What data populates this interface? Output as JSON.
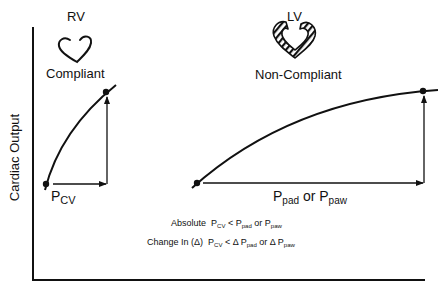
{
  "diagram": {
    "y_axis_label": "Cardiac Output",
    "rv": {
      "title": "RV",
      "heart_icon": "outline-heart-icon",
      "status": "Compliant",
      "pressure_label": {
        "base": "P",
        "subscript": "CV"
      }
    },
    "lv": {
      "title": "LV",
      "heart_icon": "hatched-thick-heart-icon",
      "status": "Non-Compliant",
      "pressure_label": {
        "base1": "P",
        "subscript1": "pad",
        "connector": "or",
        "base2": "P",
        "subscript2": "paw"
      }
    },
    "annotations": {
      "absolute": {
        "prefix": "Absolute",
        "lhs_base": "P",
        "lhs_sub": "CV",
        "op": "<",
        "rhs1_base": "P",
        "rhs1_sub": "pad",
        "or": "or",
        "rhs2_base": "P",
        "rhs2_sub": "paw"
      },
      "change": {
        "prefix": "Change In (Δ)",
        "lhs_base": "P",
        "lhs_sub": "CV",
        "op": "<",
        "rhs1_base": "Δ P",
        "rhs1_sub": "pad",
        "or": "or",
        "rhs2_base": "Δ P",
        "rhs2_sub": "paw"
      }
    },
    "colors": {
      "ink": "#111111",
      "background": "#ffffff"
    }
  }
}
